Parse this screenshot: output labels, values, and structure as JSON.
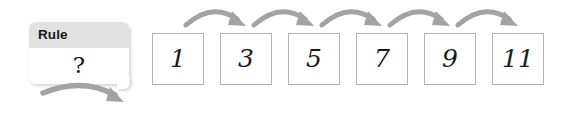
{
  "worksheet": {
    "rule_card": {
      "header_label": "Rule",
      "value": "?",
      "icon": "callout-tail"
    },
    "sequence": {
      "boxes": [
        {
          "value": "1"
        },
        {
          "value": "3"
        },
        {
          "value": "5"
        },
        {
          "value": "7"
        },
        {
          "value": "9"
        },
        {
          "value": "11"
        }
      ]
    },
    "arrows": {
      "rule_arrow_name": "rule-curved-arrow",
      "step_arrow_name": "step-curved-arrow",
      "step_arrow_count": 5,
      "color": "#a0a0a0"
    },
    "colors": {
      "header_band": "#e2e2e2",
      "box_border": "#b4b4b4",
      "arrow": "#a0a0a0",
      "text": "#1a1a1a",
      "background": "#ffffff"
    }
  }
}
